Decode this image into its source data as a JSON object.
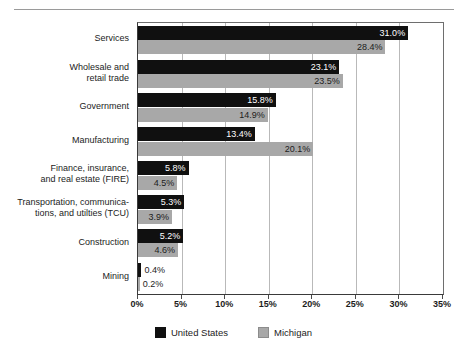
{
  "title": "Employment by Industry, 2000",
  "chart_data": {
    "type": "bar",
    "orientation": "horizontal",
    "title": "Employment by Industry, 2000",
    "xlabel": "",
    "ylabel": "",
    "xlim": [
      0,
      35
    ],
    "xunit": "%",
    "grid": true,
    "legend_position": "bottom",
    "categories": [
      "Services",
      "Wholesale and\nretail trade",
      "Government",
      "Manufacturing",
      "Finance, insurance,\nand real estate (FIRE)",
      "Transportation, communica-\ntions, and utilties (TCU)",
      "Construction",
      "Mining"
    ],
    "tick_labels": [
      "0%",
      "5%",
      "10%",
      "15%",
      "20%",
      "25%",
      "30%",
      "35%"
    ],
    "tick_values": [
      0,
      5,
      10,
      15,
      20,
      25,
      30,
      35
    ],
    "series": [
      {
        "name": "United States",
        "color": "#101010",
        "values": [
          31.0,
          23.1,
          15.8,
          13.4,
          5.8,
          5.3,
          5.2,
          0.4
        ],
        "labels": [
          "31.0%",
          "23.1%",
          "15.8%",
          "13.4%",
          "5.8%",
          "5.3%",
          "5.2%",
          "0.4%"
        ]
      },
      {
        "name": "Michigan",
        "color": "#a8a8a8",
        "values": [
          28.4,
          23.5,
          14.9,
          20.1,
          4.5,
          3.9,
          4.6,
          0.2
        ],
        "labels": [
          "28.4%",
          "23.5%",
          "14.9%",
          "20.1%",
          "4.5%",
          "3.9%",
          "4.6%",
          "0.2%"
        ]
      }
    ]
  },
  "legend": {
    "entries": [
      {
        "label": "United States",
        "swatch": "black-square-swatch"
      },
      {
        "label": "Michigan",
        "swatch": "gray-square-swatch"
      }
    ]
  }
}
